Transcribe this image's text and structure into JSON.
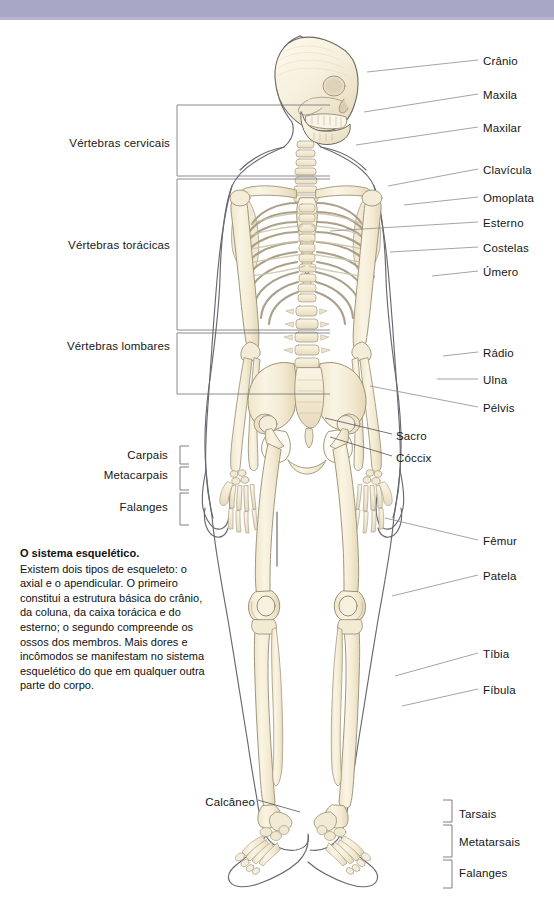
{
  "page": {
    "title": "O sistema esquelético",
    "language": "pt-BR",
    "band_color": "#a8a7c6",
    "bone_color": "#f6efdc",
    "bone_shade": "#e0d5b8",
    "outline_color": "#55555c",
    "leader_color": "#8d8d92",
    "text_color": "#161616"
  },
  "caption": {
    "title": "O sistema esquelético.",
    "body": "Existem dois tipos de esqueleto: o axial e o apendicular. O primeiro constitui a estrutura básica do crânio, da coluna, da caixa torácica e do esterno; o segundo compreende os ossos dos membros. Mais dores e incômodos se manifestam no sistema esquelético do que em qualquer outra parte do corpo."
  },
  "labels_right": [
    {
      "id": "cranio",
      "text": "Crânio",
      "x": 483,
      "y": 62
    },
    {
      "id": "maxila",
      "text": "Maxila",
      "x": 483,
      "y": 96
    },
    {
      "id": "maxilar",
      "text": "Maxilar",
      "x": 483,
      "y": 129
    },
    {
      "id": "clavicula",
      "text": "Clavícula",
      "x": 483,
      "y": 171
    },
    {
      "id": "omoplata",
      "text": "Omoplata",
      "x": 483,
      "y": 199
    },
    {
      "id": "esterno",
      "text": "Esterno",
      "x": 483,
      "y": 224
    },
    {
      "id": "costelas",
      "text": "Costelas",
      "x": 483,
      "y": 249
    },
    {
      "id": "umero",
      "text": "Úmero",
      "x": 483,
      "y": 273
    },
    {
      "id": "radio",
      "text": "Rádio",
      "x": 483,
      "y": 354
    },
    {
      "id": "ulna",
      "text": "Ulna",
      "x": 483,
      "y": 381
    },
    {
      "id": "pelvis",
      "text": "Pélvis",
      "x": 483,
      "y": 409
    },
    {
      "id": "femur",
      "text": "Fêmur",
      "x": 483,
      "y": 542
    },
    {
      "id": "patela",
      "text": "Patela",
      "x": 483,
      "y": 577
    },
    {
      "id": "tibia",
      "text": "Tíbia",
      "x": 483,
      "y": 655
    },
    {
      "id": "fibula",
      "text": "Fíbula",
      "x": 483,
      "y": 691
    }
  ],
  "labels_overlay": [
    {
      "id": "sacro",
      "text": "Sacro",
      "x": 396,
      "y": 437
    },
    {
      "id": "coccix",
      "text": "Cóccix",
      "x": 396,
      "y": 459
    },
    {
      "id": "calcaneo",
      "text": "Calcâneo",
      "x": 205,
      "y": 803
    }
  ],
  "labels_left": [
    {
      "id": "vertebras-cervicais",
      "text": "Vértebras cervicais",
      "x": 170,
      "y": 144,
      "bracket_top": 105,
      "bracket_bottom": 176
    },
    {
      "id": "vertebras-toracicas",
      "text": "Vértebras torácicas",
      "x": 170,
      "y": 246,
      "bracket_top": 179,
      "bracket_bottom": 330
    },
    {
      "id": "vertebras-lombares",
      "text": "Vértebras lombares",
      "x": 170,
      "y": 347,
      "bracket_top": 333,
      "bracket_bottom": 394
    }
  ],
  "labels_hand": [
    {
      "id": "carpais",
      "text": "Carpais",
      "x": 168,
      "y": 456,
      "bracket_top": 446,
      "bracket_bottom": 464
    },
    {
      "id": "metacarpais",
      "text": "Metacarpais",
      "x": 168,
      "y": 476,
      "bracket_top": 467,
      "bracket_bottom": 490
    },
    {
      "id": "falanges",
      "text": "Falanges",
      "x": 168,
      "y": 508,
      "bracket_top": 493,
      "bracket_bottom": 525
    }
  ],
  "labels_foot": [
    {
      "id": "tarsais",
      "text": "Tarsais",
      "x": 459,
      "y": 815,
      "bracket_top": 800,
      "bracket_bottom": 822
    },
    {
      "id": "metatarsais",
      "text": "Metatarsais",
      "x": 459,
      "y": 843,
      "bracket_top": 825,
      "bracket_bottom": 857
    },
    {
      "id": "falanges-pe",
      "text": "Falanges",
      "x": 459,
      "y": 874,
      "bracket_top": 860,
      "bracket_bottom": 888
    }
  ],
  "leaders_right": [
    {
      "id": "cranio",
      "x1": 367,
      "y1": 72,
      "x2": 478,
      "y2": 60
    },
    {
      "id": "maxila",
      "x1": 364,
      "y1": 112,
      "x2": 478,
      "y2": 94
    },
    {
      "id": "maxilar",
      "x1": 356,
      "y1": 145,
      "x2": 478,
      "y2": 127
    },
    {
      "id": "clavicula",
      "x1": 388,
      "y1": 186,
      "x2": 478,
      "y2": 169
    },
    {
      "id": "omoplata",
      "x1": 404,
      "y1": 205,
      "x2": 478,
      "y2": 197
    },
    {
      "id": "esterno",
      "x1": 330,
      "y1": 231,
      "x2": 478,
      "y2": 222
    },
    {
      "id": "costelas",
      "x1": 390,
      "y1": 252,
      "x2": 478,
      "y2": 247
    },
    {
      "id": "umero",
      "x1": 432,
      "y1": 276,
      "x2": 478,
      "y2": 271
    },
    {
      "id": "radio",
      "x1": 443,
      "y1": 356,
      "x2": 478,
      "y2": 352
    },
    {
      "id": "ulna",
      "x1": 437,
      "y1": 379,
      "x2": 478,
      "y2": 379
    },
    {
      "id": "pelvis",
      "x1": 370,
      "y1": 386,
      "x2": 478,
      "y2": 407
    },
    {
      "id": "femur",
      "x1": 385,
      "y1": 518,
      "x2": 478,
      "y2": 540
    },
    {
      "id": "patela",
      "x1": 392,
      "y1": 596,
      "x2": 478,
      "y2": 575
    },
    {
      "id": "tibia",
      "x1": 395,
      "y1": 676,
      "x2": 478,
      "y2": 653
    },
    {
      "id": "fibula",
      "x1": 402,
      "y1": 706,
      "x2": 478,
      "y2": 689
    }
  ],
  "leaders_overlay": [
    {
      "id": "sacro",
      "x1": 325,
      "y1": 418,
      "x2": 392,
      "y2": 434
    },
    {
      "id": "coccix",
      "x1": 330,
      "y1": 437,
      "x2": 392,
      "y2": 456
    },
    {
      "id": "calcaneo",
      "x1": 258,
      "y1": 800,
      "x2": 300,
      "y2": 812
    }
  ],
  "bones": {
    "skull": "Crânio",
    "spine": "Coluna vertebral",
    "ribcage": "Caixa torácica",
    "pelvis": "Pélvis",
    "arms": "Membros superiores",
    "legs": "Membros inferiores"
  }
}
